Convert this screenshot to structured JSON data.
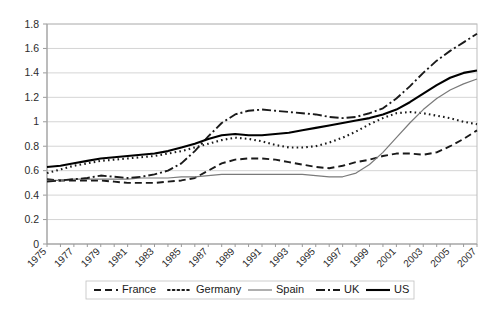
{
  "chart_data": {
    "type": "line",
    "title": "",
    "xlabel": "",
    "ylabel": "",
    "ylim": [
      0,
      1.8
    ],
    "ytick_step": 0.2,
    "grid": true,
    "legend_position": "bottom",
    "x": [
      1975,
      1976,
      1977,
      1978,
      1979,
      1980,
      1981,
      1982,
      1983,
      1984,
      1985,
      1986,
      1987,
      1988,
      1989,
      1990,
      1991,
      1992,
      1993,
      1994,
      1995,
      1996,
      1997,
      1998,
      1999,
      2000,
      2001,
      2002,
      2003,
      2004,
      2005,
      2006,
      2007
    ],
    "xtick_labels": [
      "1975",
      "1977",
      "1979",
      "1981",
      "1983",
      "1985",
      "1987",
      "1989",
      "1991",
      "1993",
      "1995",
      "1997",
      "1999",
      "2001",
      "2003",
      "2005",
      "2007"
    ],
    "ytick_labels": [
      "0",
      "0.2",
      "0.4",
      "0.6",
      "0.8",
      "1",
      "1.2",
      "1.4",
      "1.6",
      "1.8"
    ],
    "series": [
      {
        "name": "France",
        "style": "dashed",
        "color": "#1a1a1a",
        "width": 1.9,
        "dash": "7,4",
        "values": [
          0.53,
          0.52,
          0.52,
          0.52,
          0.52,
          0.51,
          0.5,
          0.5,
          0.5,
          0.51,
          0.52,
          0.54,
          0.6,
          0.66,
          0.69,
          0.7,
          0.7,
          0.69,
          0.67,
          0.65,
          0.63,
          0.62,
          0.64,
          0.67,
          0.69,
          0.72,
          0.74,
          0.74,
          0.73,
          0.75,
          0.8,
          0.86,
          0.93
        ]
      },
      {
        "name": "Germany",
        "style": "dotted",
        "color": "#1a1a1a",
        "width": 2.1,
        "dash": "1.6,3.2",
        "values": [
          0.58,
          0.61,
          0.64,
          0.66,
          0.68,
          0.69,
          0.7,
          0.71,
          0.72,
          0.74,
          0.76,
          0.79,
          0.82,
          0.85,
          0.87,
          0.86,
          0.84,
          0.81,
          0.79,
          0.79,
          0.8,
          0.83,
          0.87,
          0.92,
          0.98,
          1.03,
          1.07,
          1.08,
          1.07,
          1.05,
          1.03,
          1.0,
          0.98
        ]
      },
      {
        "name": "Spain",
        "style": "solid-thin",
        "color": "#7a7a7a",
        "width": 1.2,
        "dash": "none",
        "values": [
          0.52,
          0.52,
          0.53,
          0.53,
          0.53,
          0.53,
          0.53,
          0.54,
          0.54,
          0.54,
          0.55,
          0.55,
          0.56,
          0.57,
          0.57,
          0.57,
          0.57,
          0.57,
          0.57,
          0.57,
          0.56,
          0.55,
          0.55,
          0.58,
          0.65,
          0.75,
          0.87,
          0.99,
          1.1,
          1.19,
          1.26,
          1.31,
          1.35
        ]
      },
      {
        "name": "UK",
        "style": "dash-dot",
        "color": "#1a1a1a",
        "width": 1.9,
        "dash": "9,3,2,3",
        "values": [
          0.51,
          0.52,
          0.53,
          0.54,
          0.56,
          0.55,
          0.54,
          0.55,
          0.57,
          0.6,
          0.66,
          0.76,
          0.88,
          0.99,
          1.06,
          1.09,
          1.1,
          1.09,
          1.08,
          1.07,
          1.06,
          1.04,
          1.03,
          1.04,
          1.07,
          1.11,
          1.19,
          1.29,
          1.4,
          1.5,
          1.58,
          1.65,
          1.72
        ]
      },
      {
        "name": "US",
        "style": "solid",
        "color": "#000000",
        "width": 2.1,
        "dash": "none",
        "values": [
          0.63,
          0.64,
          0.66,
          0.68,
          0.7,
          0.71,
          0.72,
          0.73,
          0.74,
          0.76,
          0.79,
          0.82,
          0.86,
          0.89,
          0.9,
          0.89,
          0.89,
          0.9,
          0.91,
          0.93,
          0.95,
          0.97,
          0.99,
          1.01,
          1.03,
          1.06,
          1.1,
          1.16,
          1.23,
          1.3,
          1.36,
          1.4,
          1.42
        ]
      }
    ]
  },
  "legend": {
    "items": [
      {
        "label": "France"
      },
      {
        "label": "Germany"
      },
      {
        "label": "Spain"
      },
      {
        "label": "UK"
      },
      {
        "label": "US"
      }
    ]
  }
}
